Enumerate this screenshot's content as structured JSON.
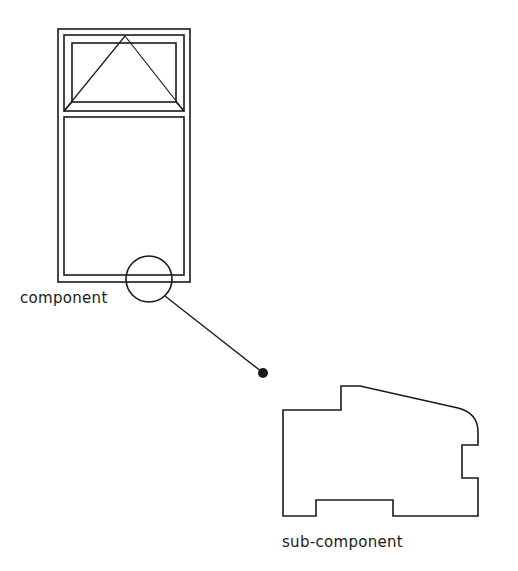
{
  "diagram": {
    "type": "component-detail",
    "labels": {
      "component": "component",
      "sub_component": "sub-component"
    },
    "colors": {
      "stroke": "#1a1a1a",
      "background": "#ffffff"
    },
    "elements": [
      {
        "id": "window-elevation",
        "kind": "window",
        "description": "Window with top-hung transom (triangle opening symbol) and fixed lower pane"
      },
      {
        "id": "detail-circle",
        "kind": "callout-circle",
        "description": "Circle marking the sill/bottom rail region"
      },
      {
        "id": "leader-line",
        "kind": "leader",
        "description": "Leader line from circle to dot"
      },
      {
        "id": "leader-dot",
        "kind": "dot"
      },
      {
        "id": "sub-component-profile",
        "kind": "section-profile",
        "description": "Sectional profile of frame member with rebates and rounded corner"
      }
    ]
  }
}
